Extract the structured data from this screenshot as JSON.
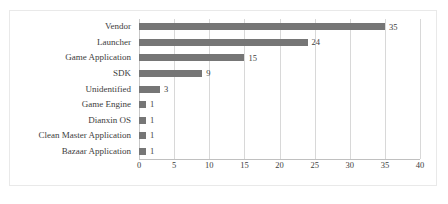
{
  "chart_data": {
    "type": "bar",
    "orientation": "horizontal",
    "title": "",
    "subtitle": "",
    "xlabel": "",
    "ylabel": "",
    "xlim": [
      0,
      40
    ],
    "xticks": [
      0,
      5,
      10,
      15,
      20,
      25,
      30,
      35,
      40
    ],
    "grid": true,
    "legend": false,
    "legend_position": "none",
    "data_labels": true,
    "bar_color": "#767676",
    "gridline_color": "#d8d8d8",
    "text_color": "#3d3d3d",
    "border_color": "#e9e9e9",
    "categories": [
      "Vendor",
      "Launcher",
      "Game Application",
      "SDK",
      "Unidentified",
      "Game Engine",
      "Dianxin OS",
      "Clean Master Application",
      "Bazaar Application"
    ],
    "values": [
      35,
      24,
      15,
      9,
      3,
      1,
      1,
      1,
      1
    ],
    "value_labels": [
      "35",
      "24",
      "15",
      "9",
      "3",
      "1",
      "1",
      "1",
      "1"
    ],
    "tick_labels": [
      "0",
      "5",
      "10",
      "15",
      "20",
      "25",
      "30",
      "35",
      "40"
    ]
  }
}
